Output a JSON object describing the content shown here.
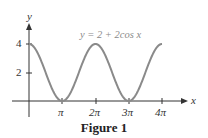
{
  "chart_data": {
    "type": "line",
    "title": "",
    "equation_label": "y = 2 + 2cos x",
    "xlabel": "x",
    "ylabel": "y",
    "x_ticks": [
      "π",
      "2π",
      "3π",
      "4π"
    ],
    "y_ticks": [
      "2",
      "4"
    ],
    "xlim": [
      0,
      "4π"
    ],
    "ylim": [
      0,
      4
    ],
    "grid": false,
    "series": [
      {
        "name": "y = 2 + 2cos x",
        "x": [
          "0",
          "π/2",
          "π",
          "3π/2",
          "2π",
          "5π/2",
          "3π",
          "7π/2",
          "4π"
        ],
        "values": [
          4,
          2,
          0,
          2,
          4,
          2,
          0,
          2,
          4
        ]
      }
    ],
    "color": "#8a8a8a"
  },
  "caption": "Figure 1",
  "labels": {
    "x_axis": "x",
    "y_axis": "y",
    "y4": "4",
    "y2": "2",
    "pi": "π",
    "two_pi": "2π",
    "three_pi": "3π",
    "four_pi": "4π"
  }
}
